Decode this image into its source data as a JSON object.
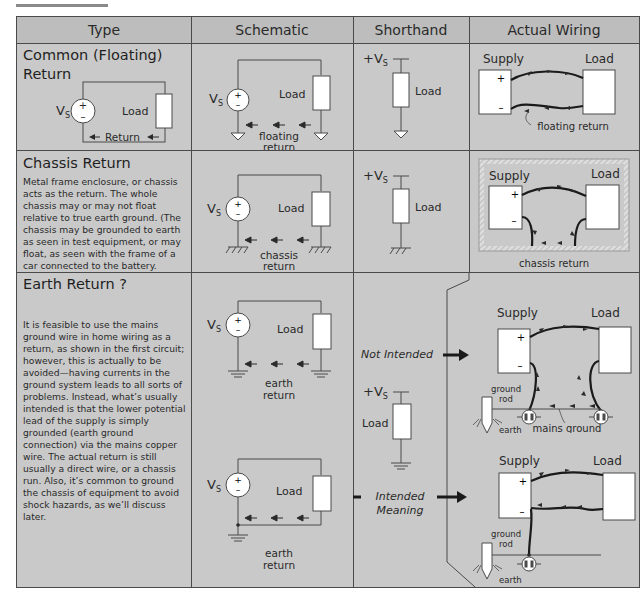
{
  "table": {
    "headers": [
      "Type",
      "Schematic",
      "Shorthand",
      "Actual Wiring"
    ]
  },
  "rows": [
    {
      "title_line1": "Common (Floating)",
      "title_line2": "Return",
      "type_diagram": {
        "source": "VS",
        "load": "Load",
        "return": "Return"
      },
      "schematic": {
        "source": "VS",
        "load": "Load",
        "return_line1": "floating",
        "return_line2": "return"
      },
      "shorthand": {
        "supply": "+VS",
        "load": "Load"
      },
      "wiring": {
        "supply": "Supply",
        "load": "Load",
        "plus": "+",
        "minus": "−",
        "caption": "floating return"
      }
    },
    {
      "title": "Chassis Return",
      "description": "Metal frame enclosure, or chassis acts as the return. The whole chassis may or may not float relative to true earth ground.  (The chassis may be grounded to earth as seen in test equipment, or may float, as seen with the frame of a car connected to the battery.",
      "schematic": {
        "source": "VS",
        "load": "Load",
        "return_line1": "chassis",
        "return_line2": "return"
      },
      "shorthand": {
        "supply": "+VS",
        "load": "Load"
      },
      "wiring": {
        "supply": "Supply",
        "load": "Load",
        "plus": "+",
        "minus": "−",
        "caption": "chassis return"
      }
    },
    {
      "title": "Earth Return ?",
      "description": "It is feasible to use the mains ground wire in home wiring as a return, as shown in the first circuit; however, this is actually to be avoided—having currents in the ground system leads to all sorts of problems.  Instead, what’s usually intended is that the lower potential lead of the supply is simply grounded (earth ground connection) via the mains copper wire.  The actual return is still usually a direct wire, or a chassis run.  Also, it’s common to ground the chassis of equipment to avoid shock hazards, as we’ll discuss later.",
      "schematic_top": {
        "source": "VS",
        "load": "Load",
        "return_line1": "earth",
        "return_line2": "return"
      },
      "schematic_bottom": {
        "source": "VS",
        "load": "Load",
        "return_line1": "earth",
        "return_line2": "return"
      },
      "shorthand": {
        "supply": "+VS",
        "load": "Load",
        "not_intended": "Not Intended",
        "intended_line1": "Intended",
        "intended_line2": "Meaning"
      },
      "wiring_top": {
        "supply": "Supply",
        "load": "Load",
        "plus": "+",
        "minus": "−",
        "ground_rod_line1": "ground",
        "ground_rod_line2": "rod",
        "earth": "earth",
        "mains_ground": "mains ground"
      },
      "wiring_bottom": {
        "supply": "Supply",
        "load": "Load",
        "plus": "+",
        "minus": "−",
        "ground_rod_line1": "ground",
        "ground_rod_line2": "rod",
        "earth": "earth"
      }
    }
  ],
  "colors": {
    "cell_bg": "#c9c9c9",
    "header_bg": "#bdbdbd",
    "line": "#4a4a4a",
    "box": "#ffffff"
  }
}
